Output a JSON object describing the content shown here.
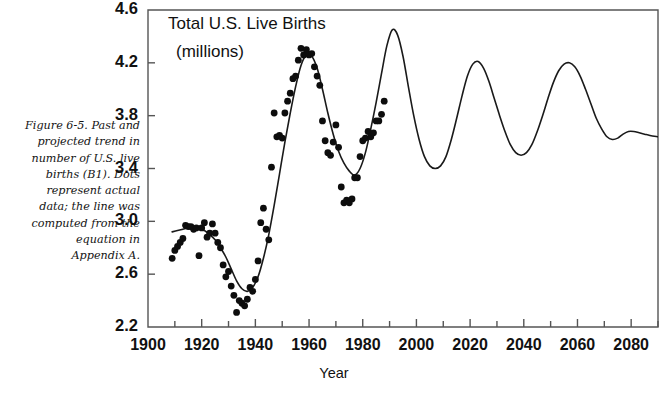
{
  "figure": {
    "caption": "Figure 6-5. Past and\nprojected trend in\nnumber of U.S. live\nbirths (B1). Dots\nrepresent actual\ndata; the line was\ncomputed from the\nequation in\nAppendix A."
  },
  "chart_data": {
    "type": "line",
    "title": "Total U.S. Live Births",
    "subtitle": "(millions)",
    "xlabel": "Year",
    "ylabel": "",
    "xlim": [
      1900,
      2090
    ],
    "ylim": [
      2.2,
      4.6
    ],
    "grid": false,
    "legend": null,
    "colors": {
      "line": "#1a1a1a",
      "dots": "#0d0d0d",
      "axis": "#555555",
      "background": "#ffffff"
    },
    "y_ticks": [
      2.2,
      2.6,
      3.0,
      3.4,
      3.8,
      4.2,
      4.6
    ],
    "y_tick_labels": [
      "2.2",
      "2.6",
      "3.0",
      "3.4",
      "3.8",
      "4.2",
      "4.6"
    ],
    "x_ticks": [
      1900,
      1920,
      1940,
      1960,
      1980,
      2000,
      2020,
      2040,
      2060,
      2080
    ],
    "x_tick_labels": [
      "1900",
      "1920",
      "1940",
      "1960",
      "1980",
      "2000",
      "2020",
      "2040",
      "2060",
      "2080"
    ],
    "x_minor_tick_interval": 10,
    "series": [
      {
        "name": "Computed trend (equation in Appendix A)",
        "style": "line",
        "x": [
          1909,
          1911,
          1913,
          1915,
          1917,
          1919,
          1921,
          1923,
          1925,
          1927,
          1929,
          1931,
          1933,
          1935,
          1937,
          1939,
          1941,
          1943,
          1945,
          1947,
          1949,
          1951,
          1953,
          1955,
          1957,
          1959,
          1961,
          1963,
          1965,
          1967,
          1969,
          1971,
          1973,
          1975,
          1977,
          1979,
          1981,
          1983,
          1985,
          1987,
          1989,
          1991,
          1993,
          1995,
          1997,
          1999,
          2001,
          2003,
          2005,
          2007,
          2009,
          2011,
          2013,
          2015,
          2017,
          2019,
          2021,
          2023,
          2025,
          2027,
          2029,
          2031,
          2033,
          2035,
          2037,
          2039,
          2041,
          2043,
          2045,
          2047,
          2049,
          2051,
          2053,
          2055,
          2057,
          2059,
          2061,
          2063,
          2065,
          2067,
          2069,
          2071,
          2073,
          2075,
          2077,
          2079,
          2081,
          2083,
          2085,
          2087,
          2090
        ],
        "y": [
          2.92,
          2.93,
          2.94,
          2.95,
          2.95,
          2.94,
          2.93,
          2.9,
          2.86,
          2.8,
          2.73,
          2.64,
          2.55,
          2.49,
          2.47,
          2.5,
          2.58,
          2.72,
          2.9,
          3.12,
          3.36,
          3.6,
          3.82,
          4.02,
          4.18,
          4.26,
          4.25,
          4.16,
          4.0,
          3.82,
          3.66,
          3.53,
          3.44,
          3.38,
          3.35,
          3.4,
          3.52,
          3.7,
          3.9,
          4.12,
          4.33,
          4.45,
          4.41,
          4.25,
          4.02,
          3.8,
          3.62,
          3.49,
          3.42,
          3.4,
          3.42,
          3.49,
          3.62,
          3.78,
          3.95,
          4.1,
          4.19,
          4.21,
          4.16,
          4.06,
          3.93,
          3.8,
          3.68,
          3.58,
          3.52,
          3.5,
          3.52,
          3.58,
          3.68,
          3.8,
          3.93,
          4.05,
          4.14,
          4.19,
          4.2,
          4.17,
          4.1,
          4.0,
          3.89,
          3.78,
          3.7,
          3.64,
          3.62,
          3.63,
          3.66,
          3.68,
          3.68,
          3.67,
          3.66,
          3.65,
          3.64
        ]
      },
      {
        "name": "Actual data",
        "style": "scatter",
        "x": [
          1909,
          1910,
          1911,
          1912,
          1913,
          1914,
          1915,
          1916,
          1917,
          1918,
          1919,
          1920,
          1921,
          1922,
          1923,
          1924,
          1925,
          1926,
          1927,
          1928,
          1929,
          1930,
          1931,
          1932,
          1933,
          1934,
          1935,
          1936,
          1937,
          1938,
          1939,
          1940,
          1941,
          1942,
          1943,
          1944,
          1945,
          1946,
          1947,
          1948,
          1949,
          1950,
          1951,
          1952,
          1953,
          1954,
          1955,
          1956,
          1957,
          1958,
          1959,
          1960,
          1961,
          1962,
          1963,
          1964,
          1965,
          1966,
          1967,
          1968,
          1969,
          1970,
          1971,
          1972,
          1973,
          1974,
          1975,
          1976,
          1977,
          1978,
          1979,
          1980,
          1981,
          1982,
          1983,
          1984,
          1985,
          1986,
          1987,
          1988
        ],
        "y": [
          2.72,
          2.78,
          2.81,
          2.84,
          2.87,
          2.97,
          2.96,
          2.96,
          2.94,
          2.95,
          2.74,
          2.95,
          2.99,
          2.88,
          2.91,
          2.98,
          2.91,
          2.84,
          2.8,
          2.67,
          2.58,
          2.62,
          2.51,
          2.44,
          2.31,
          2.4,
          2.38,
          2.36,
          2.41,
          2.5,
          2.47,
          2.56,
          2.7,
          2.99,
          3.1,
          2.94,
          2.86,
          3.41,
          3.82,
          3.64,
          3.65,
          3.63,
          3.82,
          3.91,
          3.97,
          4.08,
          4.1,
          4.22,
          4.31,
          4.26,
          4.3,
          4.26,
          4.27,
          4.17,
          4.1,
          4.03,
          3.76,
          3.61,
          3.52,
          3.5,
          3.6,
          3.73,
          3.56,
          3.26,
          3.14,
          3.16,
          3.14,
          3.17,
          3.33,
          3.33,
          3.49,
          3.61,
          3.63,
          3.68,
          3.64,
          3.67,
          3.76,
          3.76,
          3.81,
          3.91
        ]
      }
    ],
    "annotations": [
      {
        "text": "Total U.S. Live Births",
        "position": "top-left"
      },
      {
        "text": "(millions)",
        "position": "top-left-second-line"
      }
    ]
  }
}
